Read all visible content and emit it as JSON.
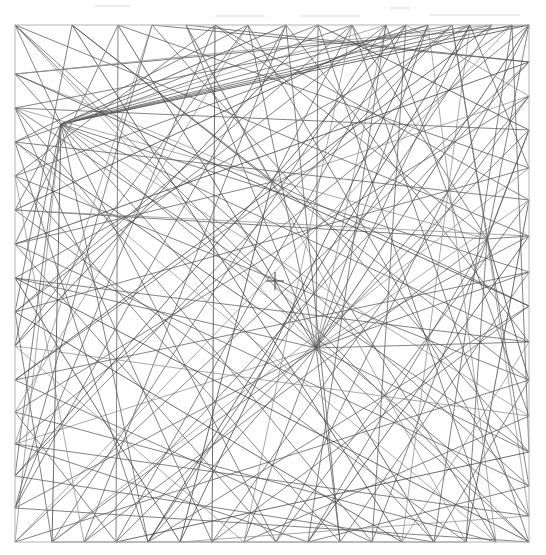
{
  "figure": {
    "type": "line-arrangement",
    "background_color": "#ffffff",
    "line_color": "#595959",
    "line_color_dark": "#3a3a3a",
    "line_color_light": "#8d8d8d",
    "frame_color": "#b4b4b4",
    "mark_color": "#4a4a4a",
    "line_width": 0.75,
    "frame": {
      "x": 15,
      "y": 25,
      "width": 514,
      "height": 517
    },
    "center_mark": {
      "cx": 275,
      "cy": 281,
      "arm": 9,
      "shape": "plus"
    },
    "hubs": [
      {
        "name": "hub-lower-center",
        "x": 316,
        "y": 348,
        "degree": 22
      },
      {
        "name": "hub-upper-left",
        "x": 61,
        "y": 124,
        "degree": 18
      },
      {
        "name": "hub-right",
        "x": 487,
        "y": 239,
        "degree": 11
      },
      {
        "name": "hub-upper-center",
        "x": 272,
        "y": 182,
        "degree": 9
      }
    ],
    "nodes": [
      {
        "id": 0,
        "x": 15,
        "y": 25
      },
      {
        "id": 1,
        "x": 72,
        "y": 25
      },
      {
        "id": 2,
        "x": 118,
        "y": 25
      },
      {
        "id": 3,
        "x": 152,
        "y": 25
      },
      {
        "id": 4,
        "x": 186,
        "y": 25
      },
      {
        "id": 5,
        "x": 215,
        "y": 25
      },
      {
        "id": 6,
        "x": 248,
        "y": 25
      },
      {
        "id": 7,
        "x": 286,
        "y": 25
      },
      {
        "id": 8,
        "x": 318,
        "y": 25
      },
      {
        "id": 9,
        "x": 352,
        "y": 25
      },
      {
        "id": 10,
        "x": 386,
        "y": 25
      },
      {
        "id": 11,
        "x": 406,
        "y": 25
      },
      {
        "id": 12,
        "x": 428,
        "y": 25
      },
      {
        "id": 13,
        "x": 452,
        "y": 25
      },
      {
        "id": 14,
        "x": 470,
        "y": 25
      },
      {
        "id": 15,
        "x": 492,
        "y": 25
      },
      {
        "id": 16,
        "x": 512,
        "y": 25
      },
      {
        "id": 17,
        "x": 529,
        "y": 25
      },
      {
        "id": 18,
        "x": 529,
        "y": 62
      },
      {
        "id": 19,
        "x": 529,
        "y": 96
      },
      {
        "id": 20,
        "x": 529,
        "y": 130
      },
      {
        "id": 21,
        "x": 529,
        "y": 168
      },
      {
        "id": 22,
        "x": 529,
        "y": 200
      },
      {
        "id": 23,
        "x": 529,
        "y": 236
      },
      {
        "id": 24,
        "x": 529,
        "y": 272
      },
      {
        "id": 25,
        "x": 529,
        "y": 306
      },
      {
        "id": 26,
        "x": 529,
        "y": 342
      },
      {
        "id": 27,
        "x": 529,
        "y": 380
      },
      {
        "id": 28,
        "x": 529,
        "y": 416
      },
      {
        "id": 29,
        "x": 529,
        "y": 452
      },
      {
        "id": 30,
        "x": 529,
        "y": 486
      },
      {
        "id": 31,
        "x": 529,
        "y": 516
      },
      {
        "id": 32,
        "x": 529,
        "y": 542
      },
      {
        "id": 33,
        "x": 496,
        "y": 542
      },
      {
        "id": 34,
        "x": 466,
        "y": 542
      },
      {
        "id": 35,
        "x": 434,
        "y": 542
      },
      {
        "id": 36,
        "x": 402,
        "y": 542
      },
      {
        "id": 37,
        "x": 372,
        "y": 542
      },
      {
        "id": 38,
        "x": 340,
        "y": 542
      },
      {
        "id": 39,
        "x": 308,
        "y": 542
      },
      {
        "id": 40,
        "x": 276,
        "y": 542
      },
      {
        "id": 41,
        "x": 244,
        "y": 542
      },
      {
        "id": 42,
        "x": 212,
        "y": 542
      },
      {
        "id": 43,
        "x": 180,
        "y": 542
      },
      {
        "id": 44,
        "x": 148,
        "y": 542
      },
      {
        "id": 45,
        "x": 116,
        "y": 542
      },
      {
        "id": 46,
        "x": 84,
        "y": 542
      },
      {
        "id": 47,
        "x": 52,
        "y": 542
      },
      {
        "id": 48,
        "x": 15,
        "y": 542
      },
      {
        "id": 49,
        "x": 15,
        "y": 508
      },
      {
        "id": 50,
        "x": 15,
        "y": 476
      },
      {
        "id": 51,
        "x": 15,
        "y": 444
      },
      {
        "id": 52,
        "x": 15,
        "y": 412
      },
      {
        "id": 53,
        "x": 15,
        "y": 380
      },
      {
        "id": 54,
        "x": 15,
        "y": 346
      },
      {
        "id": 55,
        "x": 15,
        "y": 312
      },
      {
        "id": 56,
        "x": 15,
        "y": 278
      },
      {
        "id": 57,
        "x": 15,
        "y": 244
      },
      {
        "id": 58,
        "x": 15,
        "y": 210
      },
      {
        "id": 59,
        "x": 15,
        "y": 176
      },
      {
        "id": 60,
        "x": 15,
        "y": 142
      },
      {
        "id": 61,
        "x": 15,
        "y": 108
      },
      {
        "id": 62,
        "x": 15,
        "y": 74
      },
      {
        "id": 63,
        "x": 61,
        "y": 124
      },
      {
        "id": 64,
        "x": 316,
        "y": 348
      },
      {
        "id": 65,
        "x": 487,
        "y": 239
      },
      {
        "id": 66,
        "x": 272,
        "y": 182
      }
    ],
    "edges": [
      [
        63,
        17
      ],
      [
        63,
        16
      ],
      [
        63,
        15
      ],
      [
        63,
        14
      ],
      [
        63,
        12
      ],
      [
        63,
        10
      ],
      [
        63,
        8
      ],
      [
        63,
        7
      ],
      [
        63,
        24
      ],
      [
        63,
        26
      ],
      [
        63,
        28
      ],
      [
        63,
        31
      ],
      [
        63,
        40
      ],
      [
        63,
        44
      ],
      [
        63,
        47
      ],
      [
        63,
        48
      ],
      [
        63,
        50
      ],
      [
        63,
        54
      ],
      [
        63,
        58
      ],
      [
        63,
        0
      ],
      [
        64,
        0
      ],
      [
        64,
        2
      ],
      [
        64,
        4
      ],
      [
        64,
        6
      ],
      [
        64,
        8
      ],
      [
        64,
        10
      ],
      [
        64,
        12
      ],
      [
        64,
        14
      ],
      [
        64,
        17
      ],
      [
        64,
        19
      ],
      [
        64,
        22
      ],
      [
        64,
        24
      ],
      [
        64,
        26
      ],
      [
        64,
        29
      ],
      [
        64,
        32
      ],
      [
        64,
        35
      ],
      [
        64,
        38
      ],
      [
        64,
        41
      ],
      [
        64,
        44
      ],
      [
        64,
        47
      ],
      [
        64,
        51
      ],
      [
        64,
        56
      ],
      [
        64,
        60
      ],
      [
        65,
        5
      ],
      [
        65,
        9
      ],
      [
        65,
        13
      ],
      [
        65,
        17
      ],
      [
        65,
        20
      ],
      [
        65,
        23
      ],
      [
        65,
        27
      ],
      [
        65,
        31
      ],
      [
        65,
        34
      ],
      [
        65,
        39
      ],
      [
        65,
        46
      ],
      [
        65,
        58
      ],
      [
        65,
        61
      ],
      [
        66,
        1
      ],
      [
        66,
        4
      ],
      [
        66,
        9
      ],
      [
        66,
        13
      ],
      [
        66,
        19
      ],
      [
        66,
        25
      ],
      [
        66,
        33
      ],
      [
        66,
        43
      ],
      [
        66,
        57
      ],
      [
        66,
        62
      ],
      [
        0,
        32
      ],
      [
        0,
        23
      ],
      [
        0,
        30
      ],
      [
        1,
        27
      ],
      [
        1,
        36
      ],
      [
        2,
        21
      ],
      [
        2,
        45
      ],
      [
        3,
        29
      ],
      [
        3,
        49
      ],
      [
        4,
        34
      ],
      [
        4,
        18
      ],
      [
        5,
        42
      ],
      [
        5,
        22
      ],
      [
        6,
        31
      ],
      [
        6,
        52
      ],
      [
        7,
        26
      ],
      [
        7,
        46
      ],
      [
        8,
        33
      ],
      [
        8,
        20
      ],
      [
        9,
        41
      ],
      [
        9,
        55
      ],
      [
        10,
        28
      ],
      [
        10,
        47
      ],
      [
        11,
        37
      ],
      [
        11,
        19
      ],
      [
        12,
        43
      ],
      [
        12,
        59
      ],
      [
        13,
        30
      ],
      [
        13,
        50
      ],
      [
        14,
        36
      ],
      [
        14,
        21
      ],
      [
        15,
        44
      ],
      [
        15,
        53
      ],
      [
        16,
        29
      ],
      [
        16,
        48
      ],
      [
        17,
        40
      ],
      [
        17,
        51
      ],
      [
        17,
        62
      ],
      [
        18,
        46
      ],
      [
        18,
        57
      ],
      [
        19,
        42
      ],
      [
        19,
        52
      ],
      [
        20,
        37
      ],
      [
        20,
        61
      ],
      [
        21,
        47
      ],
      [
        21,
        55
      ],
      [
        22,
        34
      ],
      [
        22,
        60
      ],
      [
        23,
        49
      ],
      [
        23,
        58
      ],
      [
        24,
        38
      ],
      [
        24,
        53
      ],
      [
        25,
        44
      ],
      [
        25,
        62
      ],
      [
        26,
        36
      ],
      [
        26,
        56
      ],
      [
        27,
        48
      ],
      [
        27,
        59
      ],
      [
        28,
        41
      ],
      [
        28,
        54
      ],
      [
        29,
        45
      ],
      [
        29,
        61
      ],
      [
        30,
        39
      ],
      [
        30,
        57
      ],
      [
        31,
        43
      ],
      [
        31,
        51
      ],
      [
        32,
        49
      ],
      [
        32,
        56
      ],
      [
        33,
        52
      ],
      [
        33,
        60
      ],
      [
        34,
        47
      ],
      [
        34,
        58
      ],
      [
        35,
        50
      ],
      [
        35,
        62
      ],
      [
        36,
        55
      ],
      [
        37,
        53
      ],
      [
        38,
        59
      ],
      [
        39,
        51
      ],
      [
        40,
        57
      ],
      [
        41,
        54
      ],
      [
        42,
        61
      ],
      [
        43,
        56
      ],
      [
        44,
        60
      ],
      [
        45,
        52
      ],
      [
        46,
        59
      ],
      [
        47,
        55
      ],
      [
        48,
        18
      ],
      [
        49,
        7
      ],
      [
        50,
        11
      ],
      [
        51,
        3
      ],
      [
        53,
        16
      ],
      [
        54,
        6
      ],
      [
        55,
        10
      ],
      [
        56,
        14
      ],
      [
        57,
        2
      ],
      [
        58,
        11
      ],
      [
        59,
        5
      ],
      [
        60,
        9
      ],
      [
        61,
        13
      ],
      [
        62,
        15
      ],
      [
        45,
        20
      ],
      [
        42,
        25
      ],
      [
        39,
        23
      ],
      [
        35,
        27
      ],
      [
        2,
        57
      ],
      [
        6,
        60
      ],
      [
        3,
        18
      ],
      [
        1,
        55
      ],
      [
        5,
        49
      ],
      [
        8,
        54
      ],
      [
        11,
        45
      ],
      [
        7,
        38
      ],
      [
        40,
        22
      ],
      [
        37,
        61
      ],
      [
        12,
        33
      ],
      [
        16,
        35
      ],
      [
        14,
        44
      ],
      [
        10,
        39
      ],
      [
        9,
        32
      ]
    ]
  }
}
